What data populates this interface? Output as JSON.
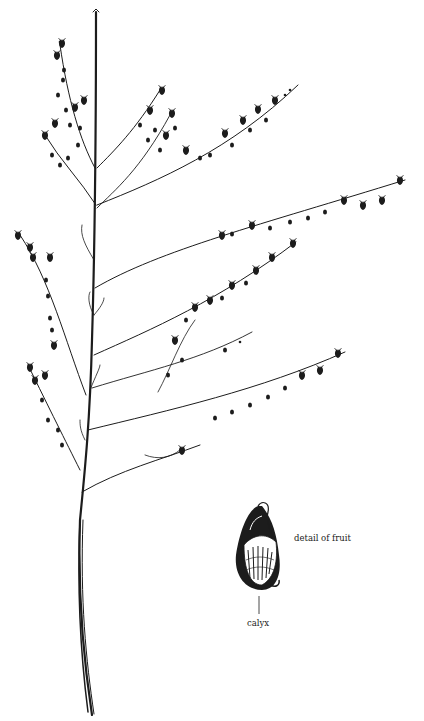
{
  "figure": {
    "style": "pen-and-ink botanical illustration",
    "ink_color": "#1c1c1c",
    "background_color": "#ffffff"
  },
  "labels": {
    "detail": "detail of fruit",
    "calyx": "calyx"
  }
}
